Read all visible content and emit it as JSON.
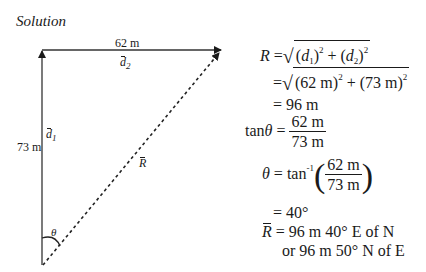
{
  "heading": "Solution",
  "diagram": {
    "d2_magnitude": "62 m",
    "d2_label": "d",
    "d2_sub": "2",
    "d1_magnitude": "73 m",
    "d1_label": "d",
    "d1_sub": "1",
    "resultant_label": "R",
    "angle_label": "θ"
  },
  "equations": {
    "line1": {
      "lhs": "R",
      "eq": "=",
      "d": "d",
      "s1": "1",
      "s2": "2",
      "pow": "2"
    },
    "line2": {
      "eq": "=",
      "a": "(62 m)",
      "b": "(73 m)",
      "pow": "2",
      "plus": "+"
    },
    "line3": "= 96 m",
    "line4": {
      "lhs": "tan",
      "theta": "θ",
      "eq": "=",
      "num": "62 m",
      "den": "73 m"
    },
    "line5": {
      "theta": "θ",
      "eq": "=",
      "fn": "tan",
      "inv": "-1",
      "num": "62 m",
      "den": "73 m"
    },
    "line6": "= 40°",
    "line7": {
      "lhs": "R",
      "rhs": "= 96 m 40° E of N"
    },
    "line8": "or 96 m 50° N of E"
  }
}
